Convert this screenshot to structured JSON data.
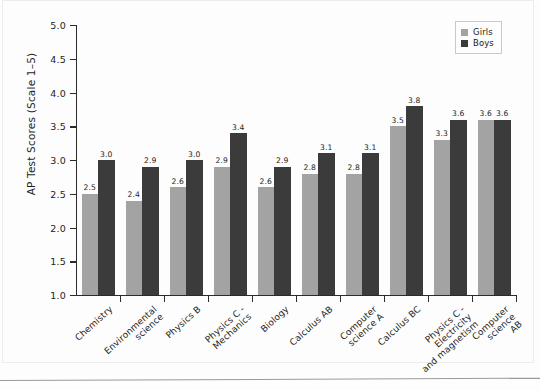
{
  "chart_data": {
    "type": "bar",
    "title": "",
    "subtitle": "",
    "xlabel": "",
    "ylabel": "AP Test Scores (Scale 1–5)",
    "ylim": [
      1.0,
      5.0
    ],
    "ytick_step": 0.5,
    "ytick_labels": [
      "5.0",
      "4.5",
      "4.0",
      "3.5",
      "3.0",
      "2.5",
      "2.0",
      "1.5",
      "1.0"
    ],
    "ytick_values": [
      5.0,
      4.5,
      4.0,
      3.5,
      3.0,
      2.5,
      2.0,
      1.5,
      1.0
    ],
    "grid": false,
    "legend_position": "top-right",
    "categories": [
      "Chemistry",
      "Environmental\nscience",
      "Physics B",
      "Physics C -\nMechanics",
      "Biology",
      "Calculus AB",
      "Computer\nscience A",
      "Calculus BC",
      "Physics C - Electricity\nand magnetism",
      "Computer\nscience AB"
    ],
    "series": [
      {
        "name": "Girls",
        "color": "#a3a3a3",
        "values": [
          2.5,
          2.4,
          2.6,
          2.9,
          2.6,
          2.8,
          2.8,
          3.5,
          3.3,
          3.6
        ],
        "labels": [
          "2.5",
          "2.4",
          "2.6",
          "2.9",
          "2.6",
          "2.8",
          "2.8",
          "3.5",
          "3.3",
          "3.6"
        ]
      },
      {
        "name": "Boys",
        "color": "#3b3b3b",
        "values": [
          3.0,
          2.9,
          3.0,
          3.4,
          2.9,
          3.1,
          3.1,
          3.8,
          3.6,
          3.6
        ],
        "labels": [
          "3.0",
          "2.9",
          "3.0",
          "3.4",
          "2.9",
          "3.1",
          "3.1",
          "3.8",
          "3.6",
          "3.6"
        ]
      }
    ]
  },
  "legend": {
    "items": [
      {
        "label": "Girls",
        "swatch": "girls"
      },
      {
        "label": "Boys",
        "swatch": "boys"
      }
    ]
  }
}
